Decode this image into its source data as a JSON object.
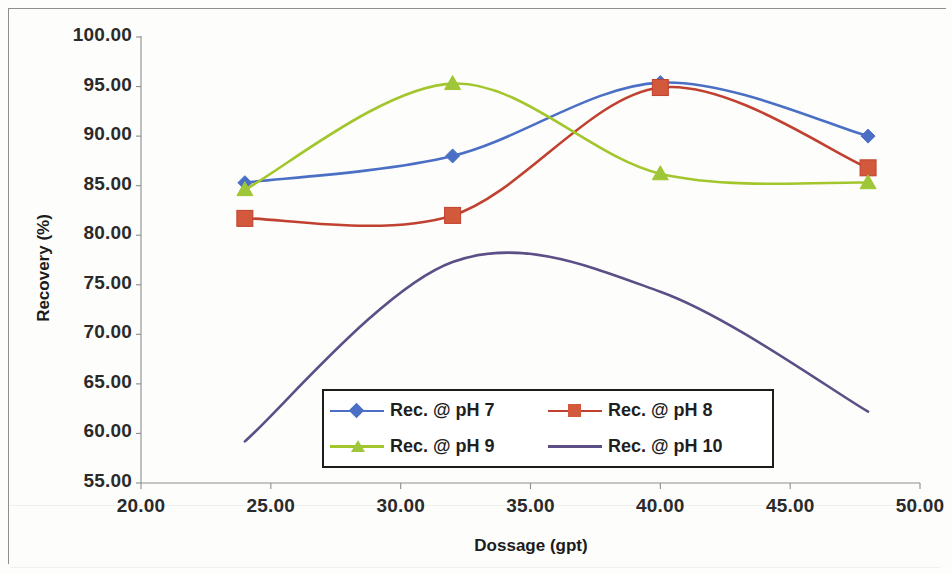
{
  "chart_data": {
    "type": "line",
    "title": "",
    "xlabel": "Dossage (gpt)",
    "ylabel": "Recovery (%)",
    "xlim": [
      20,
      50
    ],
    "ylim": [
      55,
      100
    ],
    "xticks": [
      "20.00",
      "25.00",
      "30.00",
      "35.00",
      "40.00",
      "45.00",
      "50.00"
    ],
    "yticks": [
      "55.00",
      "60.00",
      "65.00",
      "70.00",
      "75.00",
      "80.00",
      "85.00",
      "90.00",
      "95.00",
      "100.00"
    ],
    "xtick_values": [
      20,
      25,
      30,
      35,
      40,
      45,
      50
    ],
    "ytick_values": [
      55,
      60,
      65,
      70,
      75,
      80,
      85,
      90,
      95,
      100
    ],
    "grid": false,
    "legend_position": "inside-bottom-center",
    "smoothing": "smooth-spline",
    "x": [
      24,
      32,
      40,
      48
    ],
    "series": [
      {
        "name": "Rec. @ pH 7",
        "color": "#4a6fc4",
        "marker": "diamond",
        "marker_color": "#4a6fc4",
        "values": [
          85.3,
          88.0,
          95.4,
          90.0
        ]
      },
      {
        "name": "Rec. @ pH 8",
        "color": "#c0412f",
        "marker": "square",
        "marker_color": "#d2593c",
        "values": [
          81.7,
          82.0,
          94.9,
          86.8
        ]
      },
      {
        "name": "Rec. @ pH 9",
        "color": "#a2c62c",
        "marker": "triangle",
        "marker_color": "#9dc63a",
        "values": [
          84.6,
          95.3,
          86.2,
          85.3
        ]
      },
      {
        "name": "Rec. @ pH 10",
        "color": "#5b4f86",
        "marker": "none",
        "marker_color": "#5b4f86",
        "values": [
          59.2,
          77.3,
          74.3,
          62.2
        ]
      }
    ],
    "annotations": []
  },
  "legend": {
    "entries": [
      {
        "label": "Rec. @ pH 7"
      },
      {
        "label": "Rec. @ pH 8"
      },
      {
        "label": "Rec. @ pH 9"
      },
      {
        "label": "Rec. @ pH 10"
      }
    ]
  },
  "colors": {
    "ph7": "#4a6fc4",
    "ph8": "#c0412f",
    "ph9": "#a2c62c",
    "ph10": "#5b4f86",
    "axis": "#8d8d8d",
    "text": "#1b1b1b"
  }
}
